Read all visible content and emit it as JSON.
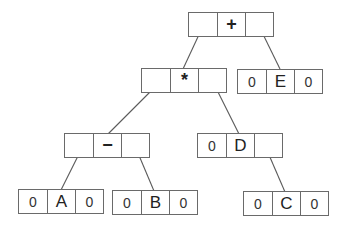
{
  "diagram": {
    "type": "binary-expression-tree-linked-nodes",
    "nodes": [
      {
        "id": "plus",
        "left": "",
        "value": "+",
        "right": "",
        "x": 188,
        "y": 12
      },
      {
        "id": "times",
        "left": "",
        "value": "*",
        "right": "",
        "x": 141,
        "y": 68
      },
      {
        "id": "E",
        "left": "0",
        "value": "E",
        "right": "0",
        "x": 237,
        "y": 69
      },
      {
        "id": "minus",
        "left": "",
        "value": "−",
        "right": "",
        "x": 64,
        "y": 133
      },
      {
        "id": "D",
        "left": "0",
        "value": "D",
        "right": "",
        "x": 197,
        "y": 133
      },
      {
        "id": "A",
        "left": "0",
        "value": "A",
        "right": "0",
        "x": 18,
        "y": 189
      },
      {
        "id": "B",
        "left": "0",
        "value": "B",
        "right": "0",
        "x": 112,
        "y": 190
      },
      {
        "id": "C",
        "left": "0",
        "value": "C",
        "right": "0",
        "x": 243,
        "y": 191
      }
    ],
    "edges": [
      {
        "from": "plus.left",
        "to": "times"
      },
      {
        "from": "plus.right",
        "to": "E"
      },
      {
        "from": "times.left",
        "to": "minus"
      },
      {
        "from": "times.right",
        "to": "D"
      },
      {
        "from": "minus.left",
        "to": "A"
      },
      {
        "from": "minus.right",
        "to": "B"
      },
      {
        "from": "D.right",
        "to": "C"
      }
    ],
    "colors": {
      "line": "#5a5a5a",
      "border": "#6a6a6a",
      "text": "#222222"
    }
  }
}
